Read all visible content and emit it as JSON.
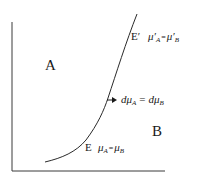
{
  "diagram": {
    "regions": [
      {
        "id": "A",
        "label": "A"
      },
      {
        "id": "B",
        "label": "B"
      }
    ],
    "points": [
      {
        "id": "E",
        "label": "E",
        "equation": {
          "lhs_sym": "μ",
          "lhs_sub": "A",
          "op": "=",
          "rhs_sym": "μ",
          "rhs_sub": "B"
        }
      },
      {
        "id": "E_prime",
        "label": "E′",
        "equation": {
          "lhs_sym": "μ′",
          "lhs_sub": "A",
          "op": "=",
          "rhs_sym": "μ′",
          "rhs_sub": "B"
        }
      }
    ],
    "arrow_annotation": {
      "lhs_sym": "dμ",
      "lhs_sub": "A",
      "op": "=",
      "rhs_sym": "dμ",
      "rhs_sub": "B"
    },
    "colors": {
      "line": "#2a2a2a",
      "text": "#1a1a1a",
      "background": "#ffffff"
    }
  }
}
